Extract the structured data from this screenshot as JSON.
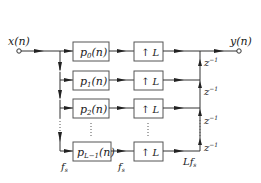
{
  "diagram": {
    "title": "",
    "input_label": "x(n)",
    "output_label": "y(n)",
    "branches": [
      {
        "filter": {
          "base": "p",
          "sub": "0",
          "arg": "(n)"
        },
        "upsampler": "↑ L"
      },
      {
        "filter": {
          "base": "p",
          "sub": "1",
          "arg": "(n)"
        },
        "upsampler": "↑ L"
      },
      {
        "filter": {
          "base": "p",
          "sub": "2",
          "arg": "(n)"
        },
        "upsampler": "↑ L"
      },
      {
        "filter": {
          "base": "p",
          "sub": "L−1",
          "arg": "(n)"
        },
        "upsampler": "↑ L"
      }
    ],
    "delay": {
      "base": "z",
      "exp": "−1"
    },
    "rate_labels": {
      "input_rate": {
        "base": "f",
        "sub": "s"
      },
      "mid_rate": {
        "base": "f",
        "sub": "s"
      },
      "output_rate": {
        "prefix": "L",
        "base": "f",
        "sub": "s"
      }
    },
    "colors": {
      "line": "#333333",
      "box_border": "#555555",
      "background": "#ffffff"
    }
  }
}
